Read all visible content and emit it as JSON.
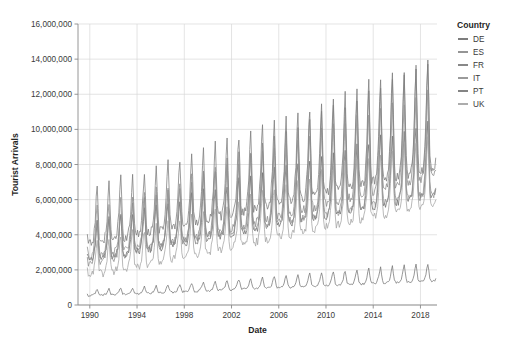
{
  "chart_data": {
    "type": "line",
    "title": "",
    "xlabel": "Date",
    "ylabel": "Tourist Arrivals",
    "xlim": [
      1989.0,
      2019.4
    ],
    "ylim": [
      0,
      16000000
    ],
    "xticks": [
      1990,
      1994,
      1998,
      2002,
      2006,
      2010,
      2014,
      2018
    ],
    "xtick_labels": [
      "1990",
      "1994",
      "1998",
      "2002",
      "2006",
      "2010",
      "2014",
      "2018"
    ],
    "yticks": [
      0,
      2000000,
      4000000,
      6000000,
      8000000,
      10000000,
      12000000,
      14000000,
      16000000
    ],
    "ytick_labels": [
      "0",
      "2,000,000",
      "4,000,000",
      "6,000,000",
      "8,000,000",
      "10,000,000",
      "12,000,000",
      "14,000,000",
      "16,000,000"
    ],
    "grid": true,
    "legend_position": "right",
    "legend_title": "Country",
    "frequency": "monthly",
    "seasonal_peak_month": 8,
    "series": [
      {
        "name": "DE",
        "color": "#6f6f6f",
        "start_level": 3200000,
        "end_level": 7600000,
        "seasonal_amplitude_start": 1600000,
        "seasonal_amplitude_end": 3100000,
        "noise": 220000
      },
      {
        "name": "ES",
        "color": "#8a8a8a",
        "start_level": 3000000,
        "end_level": 9500000,
        "seasonal_amplitude_start": 1700000,
        "seasonal_amplitude_end": 5000000,
        "noise": 260000
      },
      {
        "name": "FR",
        "color": "#7b7b7b",
        "start_level": 4400000,
        "end_level": 9800000,
        "seasonal_amplitude_start": 2300000,
        "seasonal_amplitude_end": 4700000,
        "noise": 280000
      },
      {
        "name": "IT",
        "color": "#8f8f8f",
        "start_level": 3600000,
        "end_level": 8200000,
        "seasonal_amplitude_start": 2000000,
        "seasonal_amplitude_end": 4400000,
        "noise": 240000
      },
      {
        "name": "PT",
        "color": "#767676",
        "start_level": 620000,
        "end_level": 1700000,
        "seasonal_amplitude_start": 220000,
        "seasonal_amplitude_end": 750000,
        "noise": 60000
      },
      {
        "name": "UK",
        "color": "#a3a3a3",
        "start_level": 2200000,
        "end_level": 7000000,
        "seasonal_amplitude_start": 1300000,
        "seasonal_amplitude_end": 3000000,
        "noise": 230000
      }
    ],
    "observed_peaks": [
      {
        "year": 1990,
        "value": 7100000
      },
      {
        "year": 1994,
        "value": 9400000
      },
      {
        "year": 1998,
        "value": 10500000
      },
      {
        "year": 2002,
        "value": 12000000
      },
      {
        "year": 2006,
        "value": 12300000
      },
      {
        "year": 2010,
        "value": 11800000
      },
      {
        "year": 2014,
        "value": 12900000
      },
      {
        "year": 2018,
        "value": 14700000
      },
      {
        "year": 2019,
        "value": 14900000
      }
    ]
  },
  "legend": {
    "title": "Country",
    "items": [
      {
        "label": "DE"
      },
      {
        "label": "ES"
      },
      {
        "label": "FR"
      },
      {
        "label": "IT"
      },
      {
        "label": "PT"
      },
      {
        "label": "UK"
      }
    ]
  }
}
